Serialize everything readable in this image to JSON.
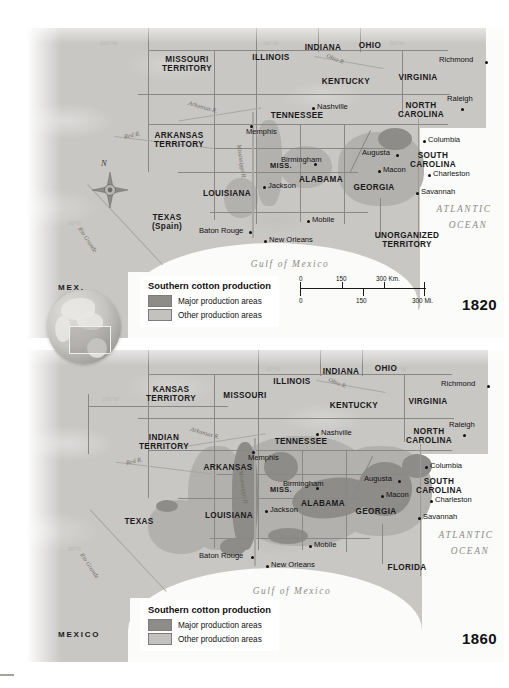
{
  "figure": {
    "title_implicit": "Southern cotton production 1820 and 1860"
  },
  "legend": {
    "title": "Southern cotton production",
    "items": [
      {
        "label": "Major production areas",
        "color": "#8e8c89"
      },
      {
        "label": "Other production areas",
        "color": "#c4c2be"
      }
    ]
  },
  "scale": {
    "km": {
      "ticks": [
        "0",
        "150",
        "300 Km."
      ]
    },
    "mi": {
      "ticks": [
        "0",
        "150",
        "300 Mi."
      ]
    }
  },
  "compass": {
    "north": "N"
  },
  "map_1820": {
    "year": "1820",
    "states": [
      {
        "name": "MISSOURI\nTERRITORY",
        "x": 158,
        "y": 30
      },
      {
        "name": "ILLINOIS",
        "x": 243,
        "y": 26
      },
      {
        "name": "INDIANA",
        "x": 295,
        "y": 16
      },
      {
        "name": "OHIO",
        "x": 343,
        "y": 14
      },
      {
        "name": "KENTUCKY",
        "x": 318,
        "y": 50
      },
      {
        "name": "VIRGINIA",
        "x": 390,
        "y": 46
      },
      {
        "name": "TENNESSEE",
        "x": 268,
        "y": 84
      },
      {
        "name": "ARKANSAS\nTERRITORY",
        "x": 150,
        "y": 108
      },
      {
        "name": "NORTH\nCAROLINA",
        "x": 392,
        "y": 76
      },
      {
        "name": "SOUTH\nCAROLINA",
        "x": 404,
        "y": 126
      },
      {
        "name": "MISS.",
        "x": 252,
        "y": 134
      },
      {
        "name": "ALABAMA",
        "x": 292,
        "y": 148
      },
      {
        "name": "GEORGIA",
        "x": 345,
        "y": 156
      },
      {
        "name": "LOUISIANA",
        "x": 198,
        "y": 162
      },
      {
        "name": "TEXAS\n(Spain)",
        "x": 138,
        "y": 188
      },
      {
        "name": "UNORGANIZED\nTERRITORY",
        "x": 378,
        "y": 206
      },
      {
        "name": "MEX.",
        "x": 45,
        "y": 257
      }
    ],
    "cities": [
      {
        "name": "Nashville",
        "x": 289,
        "y": 76,
        "anchor": "left"
      },
      {
        "name": "Memphis",
        "x": 253,
        "y": 100,
        "anchor": "left"
      },
      {
        "name": "Richmond",
        "x": 427,
        "y": 28,
        "anchor": "left"
      },
      {
        "name": "Raleigh",
        "x": 427,
        "y": 68,
        "anchor": "left"
      },
      {
        "name": "Columbia",
        "x": 399,
        "y": 110,
        "anchor": "left"
      },
      {
        "name": "Augusta",
        "x": 338,
        "y": 122,
        "anchor": "left"
      },
      {
        "name": "Macon",
        "x": 355,
        "y": 139,
        "anchor": "left"
      },
      {
        "name": "Charleston",
        "x": 404,
        "y": 143,
        "anchor": "left"
      },
      {
        "name": "Savannah",
        "x": 392,
        "y": 161,
        "anchor": "left"
      },
      {
        "name": "Birmingham",
        "x": 279,
        "y": 128,
        "anchor": "left"
      },
      {
        "name": "Jackson",
        "x": 239,
        "y": 155,
        "anchor": "left"
      },
      {
        "name": "Mobile",
        "x": 283,
        "y": 189,
        "anchor": "left"
      },
      {
        "name": "Baton Rouge",
        "x": 176,
        "y": 200,
        "anchor": "left"
      },
      {
        "name": "New Orleans",
        "x": 240,
        "y": 209,
        "anchor": "left"
      }
    ],
    "water": [
      {
        "name": "ATLANTIC",
        "x": 424,
        "y": 178
      },
      {
        "name": "OCEAN",
        "x": 434,
        "y": 194
      },
      {
        "name": "Gulf of Mexico",
        "x": 262,
        "y": 233
      }
    ],
    "rivers": [
      {
        "name": "Arkansas R.",
        "x": 180,
        "y": 82
      },
      {
        "name": "Red R.",
        "x": 106,
        "y": 110
      },
      {
        "name": "Mississippi R.",
        "x": 238,
        "y": 140
      },
      {
        "name": "Ohio R.",
        "x": 318,
        "y": 36
      },
      {
        "name": "Rio Grande",
        "x": 68,
        "y": 215
      }
    ],
    "longitudes": [
      {
        "label": "100°W",
        "x": 72,
        "y": 12
      },
      {
        "label": "90°W",
        "x": 236,
        "y": 12
      },
      {
        "label": "80°W",
        "x": 362,
        "y": 12
      },
      {
        "label": "30°N",
        "x": 40,
        "y": 192
      }
    ]
  },
  "map_1860": {
    "year": "1860",
    "states": [
      {
        "name": "KANSAS\nTERRITORY",
        "x": 142,
        "y": 38
      },
      {
        "name": "MISSOURI",
        "x": 216,
        "y": 42
      },
      {
        "name": "ILLINOIS",
        "x": 264,
        "y": 28
      },
      {
        "name": "INDIANA",
        "x": 312,
        "y": 18
      },
      {
        "name": "OHIO",
        "x": 358,
        "y": 15
      },
      {
        "name": "KENTUCKY",
        "x": 326,
        "y": 52
      },
      {
        "name": "VIRGINIA",
        "x": 400,
        "y": 48
      },
      {
        "name": "TENNESSEE",
        "x": 272,
        "y": 88
      },
      {
        "name": "INDIAN\nTERRITORY",
        "x": 136,
        "y": 88
      },
      {
        "name": "ARKANSAS",
        "x": 200,
        "y": 114
      },
      {
        "name": "NORTH\nCAROLINA",
        "x": 400,
        "y": 80
      },
      {
        "name": "SOUTH\nCAROLINA",
        "x": 410,
        "y": 130
      },
      {
        "name": "MISS.",
        "x": 252,
        "y": 136
      },
      {
        "name": "ALABAMA",
        "x": 294,
        "y": 150
      },
      {
        "name": "GEORGIA",
        "x": 348,
        "y": 158
      },
      {
        "name": "LOUISIANA",
        "x": 200,
        "y": 162
      },
      {
        "name": "TEXAS",
        "x": 110,
        "y": 170
      },
      {
        "name": "FLORIDA",
        "x": 378,
        "y": 216
      },
      {
        "name": "MEXICO",
        "x": 48,
        "y": 282
      }
    ],
    "cities": [
      {
        "name": "Nashville",
        "x": 293,
        "y": 80,
        "anchor": "left"
      },
      {
        "name": "Memphis",
        "x": 253,
        "y": 104,
        "anchor": "left"
      },
      {
        "name": "Richmond",
        "x": 429,
        "y": 30,
        "anchor": "left"
      },
      {
        "name": "Raleigh",
        "x": 429,
        "y": 72,
        "anchor": "left"
      },
      {
        "name": "Columbia",
        "x": 401,
        "y": 114,
        "anchor": "left"
      },
      {
        "name": "Augusta",
        "x": 340,
        "y": 126,
        "anchor": "left"
      },
      {
        "name": "Macon",
        "x": 358,
        "y": 142,
        "anchor": "left"
      },
      {
        "name": "Charleston",
        "x": 406,
        "y": 146,
        "anchor": "left"
      },
      {
        "name": "Savannah",
        "x": 394,
        "y": 164,
        "anchor": "left"
      },
      {
        "name": "Birmingham",
        "x": 281,
        "y": 130,
        "anchor": "left"
      },
      {
        "name": "Jackson",
        "x": 241,
        "y": 157,
        "anchor": "left"
      },
      {
        "name": "Mobile",
        "x": 285,
        "y": 192,
        "anchor": "left"
      },
      {
        "name": "Baton Rouge",
        "x": 176,
        "y": 203,
        "anchor": "left"
      },
      {
        "name": "New Orleans",
        "x": 242,
        "y": 212,
        "anchor": "left"
      }
    ],
    "water": [
      {
        "name": "ATLANTIC",
        "x": 426,
        "y": 182
      },
      {
        "name": "OCEAN",
        "x": 436,
        "y": 198
      },
      {
        "name": "Gulf of Mexico",
        "x": 264,
        "y": 238
      }
    ],
    "rivers": [
      {
        "name": "Arkansas R.",
        "x": 184,
        "y": 86
      },
      {
        "name": "Red R.",
        "x": 108,
        "y": 114
      },
      {
        "name": "Mississippi R.",
        "x": 238,
        "y": 142
      },
      {
        "name": "Ohio R.",
        "x": 320,
        "y": 38
      },
      {
        "name": "Rio Grande",
        "x": 70,
        "y": 220
      }
    ],
    "longitudes": [
      {
        "label": "100°W",
        "x": 74,
        "y": 46
      },
      {
        "label": "90°W",
        "x": 238,
        "y": 16
      },
      {
        "label": "80°W",
        "x": 364,
        "y": 16
      },
      {
        "label": "30°N",
        "x": 40,
        "y": 196
      }
    ]
  }
}
